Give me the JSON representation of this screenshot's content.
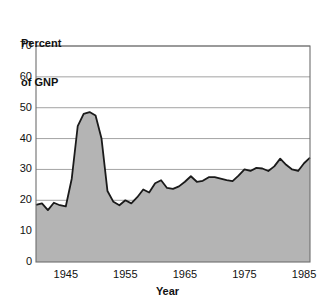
{
  "figure": {
    "cropped_caption": "",
    "plot": {
      "left": 36,
      "top": 46,
      "right": 310,
      "bottom": 262
    },
    "colors": {
      "fill": "#b4b4b4",
      "line": "#1a1a1a",
      "grid": "#8c8c8c",
      "frame": "#6e6e6e",
      "background": "#ffffff"
    }
  },
  "chart_data": {
    "type": "area",
    "title": "",
    "subtitle": "",
    "xlabel": "Year",
    "ylabel": "Percent\nof GNP",
    "ylabel_line1": "Percent",
    "ylabel_line2": "of GNP",
    "xlim": [
      1940,
      1986
    ],
    "ylim": [
      0,
      70
    ],
    "yticks": [
      0,
      10,
      20,
      30,
      40,
      50,
      60,
      70
    ],
    "ytick_labels": [
      "0",
      "10",
      "20",
      "30",
      "40",
      "50",
      "60",
      "70"
    ],
    "xticks": [
      1945,
      1955,
      1965,
      1975,
      1985
    ],
    "xtick_labels": [
      "1945",
      "1955",
      "1965",
      "1975",
      "1985"
    ],
    "grid": "horizontal",
    "legend": null,
    "annotations": [],
    "series": [
      {
        "name": "Federal debt as percent of GNP",
        "x": [
          1940,
          1941,
          1942,
          1943,
          1944,
          1945,
          1946,
          1947,
          1948,
          1949,
          1950,
          1951,
          1952,
          1953,
          1954,
          1955,
          1956,
          1957,
          1958,
          1959,
          1960,
          1961,
          1962,
          1963,
          1964,
          1965,
          1966,
          1967,
          1968,
          1969,
          1970,
          1971,
          1972,
          1973,
          1974,
          1975,
          1976,
          1977,
          1978,
          1979,
          1980,
          1981,
          1982,
          1983,
          1984,
          1985,
          1986
        ],
        "values": [
          18.5,
          19.0,
          16.8,
          19.2,
          18.4,
          18.0,
          27.0,
          44.0,
          48.0,
          48.6,
          47.5,
          40.0,
          23.0,
          19.5,
          18.4,
          20.0,
          19.0,
          21.0,
          23.5,
          22.5,
          25.5,
          26.5,
          24.0,
          23.7,
          24.5,
          26.0,
          27.8,
          26.0,
          26.3,
          27.5,
          27.5,
          27.0,
          26.5,
          26.2,
          28.0,
          30.0,
          29.5,
          30.5,
          30.3,
          29.5,
          31.0,
          33.5,
          31.5,
          30.0,
          29.5,
          32.0,
          33.8
        ]
      }
    ]
  }
}
